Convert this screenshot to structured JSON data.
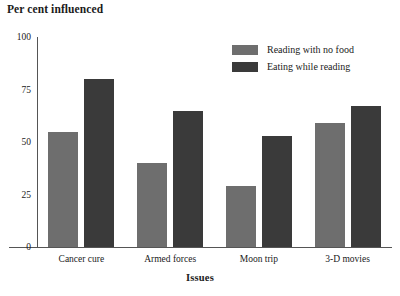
{
  "chart_data": {
    "type": "bar",
    "title": "Per cent influenced",
    "xlabel": "Issues",
    "ylabel": "",
    "ylim": [
      0,
      100
    ],
    "yticks": [
      0,
      25,
      50,
      75,
      100
    ],
    "ytick_labels": [
      "0",
      "25",
      "50",
      "75",
      "100"
    ],
    "grid": false,
    "legend_position": "top-right",
    "categories": [
      "Cancer cure",
      "Armed forces",
      "Moon trip",
      "3-D movies"
    ],
    "series": [
      {
        "name": "Reading with no food",
        "color": "#6e6e6e",
        "values": [
          55,
          40,
          29,
          59
        ]
      },
      {
        "name": "Eating while reading",
        "color": "#3a3a3a",
        "values": [
          80,
          65,
          53,
          67
        ]
      }
    ]
  },
  "axis": {
    "y_title": "Per cent influenced",
    "x_title": "Issues"
  }
}
